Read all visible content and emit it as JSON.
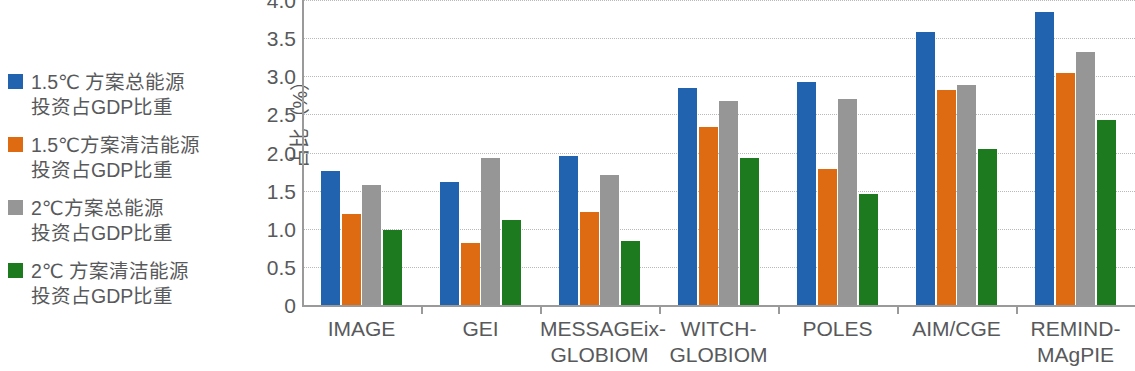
{
  "legend": {
    "items": [
      {
        "color": "#2163AE",
        "label": "1.5℃ 方案总能源\n投资占GDP比重",
        "name": "legend-item-1p5c-total-energy"
      },
      {
        "color": "#DE6A12",
        "label": "1.5℃方案清洁能源\n投资占GDP比重",
        "name": "legend-item-1p5c-clean-energy"
      },
      {
        "color": "#969696",
        "label": "2℃方案总能源\n投资占GDP比重",
        "name": "legend-item-2c-total-energy"
      },
      {
        "color": "#1E7A1E",
        "label": "2℃ 方案清洁能源\n投资占GDP比重",
        "name": "legend-item-2c-clean-energy"
      }
    ]
  },
  "chart_data": {
    "type": "bar",
    "title": "",
    "xlabel": "",
    "ylabel": "占比（%）",
    "ylim": [
      0,
      4.0
    ],
    "ytick_labels": [
      "4.0",
      "3.5",
      "3.0",
      "2.5",
      "2.0",
      "1.5",
      "1.0",
      "0.5",
      "0"
    ],
    "ytick_values": [
      4.0,
      3.5,
      3.0,
      2.5,
      2.0,
      1.5,
      1.0,
      0.5,
      0
    ],
    "grid": true,
    "legend_position": "left",
    "categories": [
      "IMAGE",
      "GEI",
      "MESSAGEix-\nGLOBIOM",
      "WITCH-\nGLOBIOM",
      "POLES",
      "AIM/CGE",
      "REMIND-\nMAgPIE"
    ],
    "series": [
      {
        "name": "1.5℃ 方案总能源投资占GDP比重",
        "color": "#2163AE",
        "values": [
          1.76,
          1.61,
          1.96,
          2.84,
          2.93,
          3.58,
          3.84
        ]
      },
      {
        "name": "1.5℃方案清洁能源投资占GDP比重",
        "color": "#DE6A12",
        "values": [
          1.19,
          0.81,
          1.22,
          2.34,
          1.78,
          2.82,
          3.04
        ]
      },
      {
        "name": "2℃方案总能源投资占GDP比重",
        "color": "#969696",
        "values": [
          1.57,
          1.93,
          1.71,
          2.67,
          2.7,
          2.88,
          3.32
        ]
      },
      {
        "name": "2℃ 方案清洁能源投资占GDP比重",
        "color": "#1E7A1E",
        "values": [
          0.98,
          1.11,
          0.84,
          1.93,
          1.45,
          2.05,
          2.43
        ]
      }
    ]
  }
}
